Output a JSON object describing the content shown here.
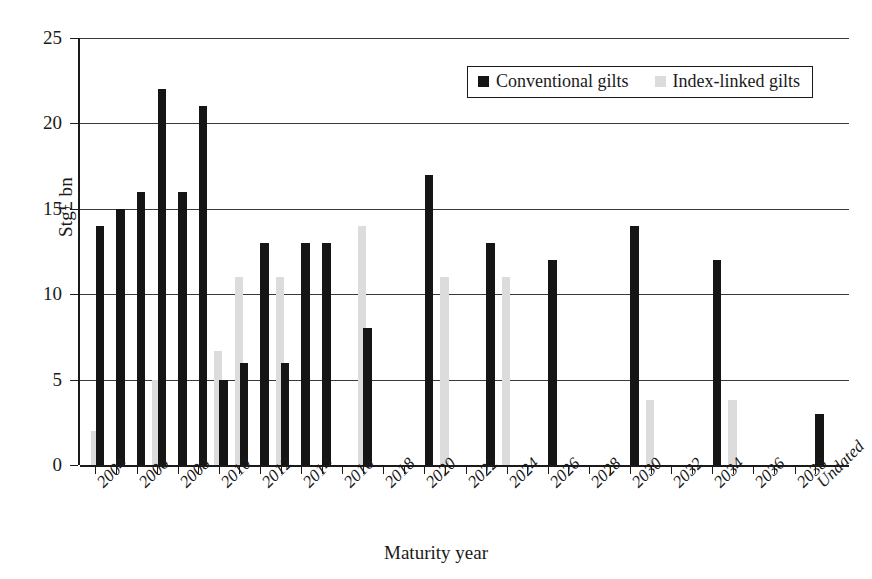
{
  "chart_data": {
    "type": "bar",
    "title": "",
    "xlabel": "Maturity year",
    "ylabel": "Stg£ bn",
    "ylim": [
      0,
      25
    ],
    "yticks": [
      0,
      5,
      10,
      15,
      20,
      25
    ],
    "grid": true,
    "legend_position": "top-right",
    "categories": [
      "2004",
      "2005",
      "2006",
      "2007",
      "2008",
      "2009",
      "2010",
      "2011",
      "2012",
      "2013",
      "2014",
      "2015",
      "2016",
      "2017",
      "2018",
      "2019",
      "2020",
      "2021",
      "2022",
      "2023",
      "2024",
      "2025",
      "2026",
      "2027",
      "2028",
      "2029",
      "2030",
      "2031",
      "2032",
      "2033",
      "2034",
      "2035",
      "2036",
      "2037",
      "2038",
      "Undated"
    ],
    "tick_labels": [
      "2004",
      "2006",
      "2008",
      "2010",
      "2012",
      "2014",
      "2016",
      "2018",
      "2020",
      "2022",
      "2024",
      "2026",
      "2028",
      "2030",
      "2032",
      "2034",
      "2036",
      "2038",
      "Undated"
    ],
    "series": [
      {
        "name": "Conventional gilts",
        "color": "#151515",
        "values": [
          14,
          15,
          16,
          22,
          16,
          21,
          5,
          6,
          13,
          6,
          13,
          13,
          0,
          8,
          0,
          0,
          17,
          0,
          0,
          13,
          0,
          0,
          12,
          0,
          0,
          0,
          14,
          0,
          0,
          0,
          12,
          0,
          0,
          0,
          0,
          3
        ]
      },
      {
        "name": "Index-linked gilts",
        "color": "#dcdcdc",
        "values": [
          2,
          0,
          0,
          5,
          0,
          0,
          6.7,
          11,
          0,
          11,
          0,
          0,
          0,
          14,
          0,
          0,
          0,
          11,
          0,
          0,
          11,
          0,
          0,
          0,
          0,
          0,
          0,
          3.8,
          0,
          0,
          0,
          3.8,
          0,
          0,
          0,
          0
        ]
      }
    ]
  },
  "legend": {
    "items": [
      {
        "label": "Conventional gilts",
        "swatch": "conv"
      },
      {
        "label": "Index-linked gilts",
        "swatch": "index"
      }
    ]
  }
}
